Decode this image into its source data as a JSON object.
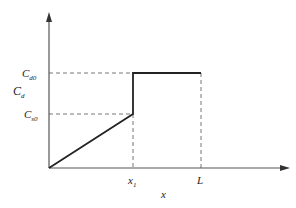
{
  "diagram": {
    "type": "piecewise-step-plot",
    "y_axis_label": "C",
    "y_axis_label_sub": "d",
    "x_axis_label": "x",
    "y_ticks": [
      {
        "main": "C",
        "sub": "d0",
        "level": "upper"
      },
      {
        "main": "C",
        "sub": "s0",
        "level": "lower"
      }
    ],
    "x_ticks": [
      {
        "main": "x",
        "sub": "1"
      },
      {
        "main": "L",
        "sub": ""
      }
    ],
    "segments": [
      {
        "from": "origin",
        "to": "(x1, Cs0)",
        "style": "solid-linear"
      },
      {
        "from": "(x1, Cs0)",
        "to": "(x1, Cd0)",
        "style": "solid-vertical-jump"
      },
      {
        "from": "(x1, Cd0)",
        "to": "(L, Cd0)",
        "style": "solid-constant"
      }
    ],
    "guides": [
      "dashed horizontal at Cd0 from y-axis to x1",
      "dashed horizontal at Cs0 from y-axis to x1",
      "dashed vertical at x1 down to x-axis",
      "dashed vertical at L down to x-axis"
    ],
    "colors": {
      "axis": "#555555",
      "curve": "#222222",
      "guide": "#777777",
      "text": "#222222"
    }
  }
}
